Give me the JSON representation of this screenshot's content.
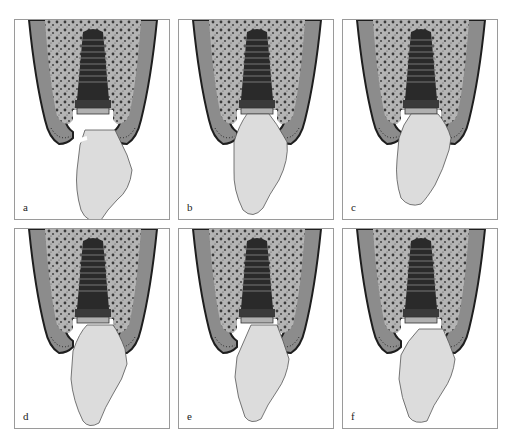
{
  "figure": {
    "panels": [
      {
        "id": "a",
        "label": "a",
        "crown_variant": "narrow-neck-gap",
        "row": 0,
        "col": 0
      },
      {
        "id": "b",
        "label": "b",
        "crown_variant": "concave-emergence",
        "row": 0,
        "col": 1
      },
      {
        "id": "c",
        "label": "c",
        "crown_variant": "offset-concave",
        "row": 0,
        "col": 2
      },
      {
        "id": "d",
        "label": "d",
        "crown_variant": "wide-convex",
        "row": 1,
        "col": 0
      },
      {
        "id": "e",
        "label": "e",
        "crown_variant": "straight-emergence",
        "row": 1,
        "col": 1
      },
      {
        "id": "f",
        "label": "f",
        "crown_variant": "over-contoured",
        "row": 1,
        "col": 2
      }
    ],
    "colors": {
      "bone_cortical": "#8c8c8c",
      "bone_outline": "#1e1e1e",
      "bone_cancellous": "#b4b4b4",
      "implant": "#2a2a2a",
      "crown": "#d8d8d8",
      "border": "#9a9a9a"
    }
  }
}
